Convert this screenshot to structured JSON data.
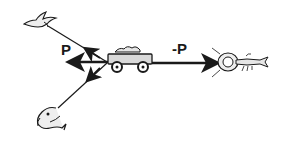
{
  "diagram": {
    "labels": {
      "force_p": "P",
      "force_neg_p": "-P"
    },
    "nodes": [
      {
        "id": "swan",
        "icon": "swan-icon"
      },
      {
        "id": "cart",
        "icon": "cart-icon"
      },
      {
        "id": "crayfish",
        "icon": "crayfish-icon"
      },
      {
        "id": "pike",
        "icon": "pike-icon"
      }
    ],
    "edges": [
      {
        "from": "cart",
        "to": "swan",
        "type": "rope-with-arrow"
      },
      {
        "from": "cart",
        "to": "pike",
        "type": "rope-with-arrow"
      },
      {
        "from": "cart",
        "to": "crayfish",
        "type": "rope-with-arrow",
        "label": "-P"
      },
      {
        "from": "cart",
        "direction": "left",
        "type": "resultant-arrow",
        "label": "P"
      }
    ],
    "colors": {
      "ink": "#1a1a1a",
      "background": "#ffffff",
      "cart_fill": "#d9d9d9"
    }
  }
}
